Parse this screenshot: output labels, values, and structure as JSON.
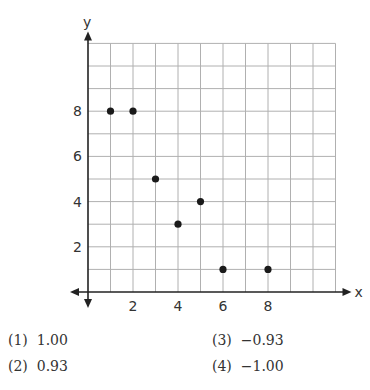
{
  "chart_data": {
    "type": "scatter",
    "title": "",
    "xlabel": "x",
    "ylabel": "y",
    "x": [
      1,
      2,
      3,
      4,
      5,
      6,
      8
    ],
    "y": [
      8,
      8,
      5,
      3,
      4,
      1,
      1
    ],
    "points": [
      [
        1,
        8
      ],
      [
        2,
        8
      ],
      [
        3,
        5
      ],
      [
        4,
        3
      ],
      [
        5,
        4
      ],
      [
        6,
        1
      ],
      [
        8,
        1
      ]
    ],
    "x_ticks": [
      "2",
      "4",
      "6",
      "8"
    ],
    "y_ticks": [
      "2",
      "4",
      "6",
      "8"
    ],
    "xlim": [
      0,
      11
    ],
    "ylim": [
      0,
      11
    ],
    "grid": true,
    "legend": null
  },
  "axes": {
    "x_label": "x",
    "y_label": "y"
  },
  "choices": [
    {
      "num": "(1)",
      "value": "1.00"
    },
    {
      "num": "(2)",
      "value": "0.93"
    },
    {
      "num": "(3)",
      "value": "−0.93"
    },
    {
      "num": "(4)",
      "value": "−1.00"
    }
  ]
}
